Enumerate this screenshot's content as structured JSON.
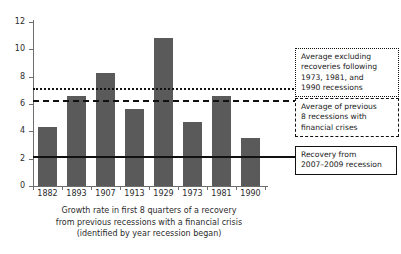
{
  "chart_data": {
    "type": "bar",
    "title": "",
    "xlabel": "Growth rate in first 8 quarters of a recovery from previous recessions with a financial crisis (identified by year recession began)",
    "ylabel": "",
    "categories": [
      "1882",
      "1893",
      "1907",
      "1913",
      "1929",
      "1973",
      "1981",
      "1990"
    ],
    "values": [
      4.35,
      6.6,
      8.25,
      5.6,
      10.8,
      4.7,
      6.6,
      3.5
    ],
    "ylim": [
      0,
      12
    ],
    "ytick_values": [
      0,
      2,
      4,
      6,
      8,
      10,
      12
    ],
    "ytick_labels": [
      "0",
      "2",
      "4",
      "6",
      "8",
      "10",
      "12"
    ],
    "grid": false,
    "legend_position": "right",
    "bar_color": "#5a5a5a",
    "reference_lines": [
      {
        "id": "avg-excluding",
        "value": 7.15,
        "style": "dotted",
        "color": "#111111",
        "label": "Average excluding recoveries following 1973, 1981, and 1990 recessions"
      },
      {
        "id": "avg-previous-8",
        "value": 6.3,
        "style": "dashed",
        "color": "#111111",
        "label": "Average of previous 8 recessions with financial crises"
      },
      {
        "id": "recovery-2007-2009",
        "value": 2.2,
        "style": "solid",
        "color": "#111111",
        "label": "Recovery from 2007-2009 recession"
      }
    ]
  },
  "axis": {
    "y_labels": [
      "12",
      "10",
      "8",
      "6",
      "4",
      "2",
      "0"
    ]
  },
  "x_labels": [
    "1882",
    "1893",
    "1907",
    "1913",
    "1929",
    "1973",
    "1981",
    "1990"
  ],
  "caption": {
    "line1": "Growth rate in first 8 quarters of a recovery",
    "line2": "from previous recessions with a financial crisis",
    "line3": "(identified by year recession began)"
  },
  "legend": {
    "dotted_box": {
      "line1": "Average excluding",
      "line2": "recoveries following",
      "line3": "1973, 1981, and",
      "line4": "1990 recessions"
    },
    "dashed_box": {
      "line1": "Average of previous",
      "line2": "8 recessions with",
      "line3": "financial crises"
    },
    "solid_box": {
      "line1": "Recovery from",
      "line2": "2007–2009 recession"
    }
  }
}
